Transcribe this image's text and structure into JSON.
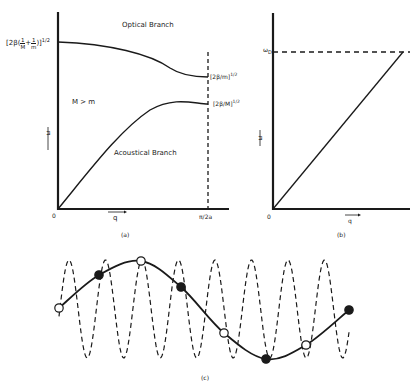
{
  "panel_a": {
    "caption": "(a)",
    "optical_label": "Optical Branch",
    "acoustical_label": "Acoustical Branch",
    "condition_label": "M > m",
    "y_axis_symbol": "ω",
    "x_axis_symbol": "q",
    "origin_label": "0",
    "x_max_label": "π/2a",
    "optical_top_label": "[2β(1/M + 1/m)]^1/2",
    "optical_top_text": "[2β(",
    "optical_top_frac1_num": "1",
    "optical_top_frac1_den": "M",
    "optical_top_plus": "+",
    "optical_top_frac2_num": "1",
    "optical_top_frac2_den": "m",
    "optical_top_close": ")]",
    "optical_top_exp": "1/2",
    "optical_edge_label": "[2β/m]^1/2",
    "optical_edge_text": "[2β/m]",
    "optical_edge_exp": "1/2",
    "acoustic_edge_label": "[2β/M]^1/2",
    "acoustic_edge_text": "[2β/M]",
    "acoustic_edge_exp": "1/2"
  },
  "panel_b": {
    "caption": "(b)",
    "y_axis_symbol": "ω",
    "x_axis_symbol": "q",
    "origin_label": "0",
    "cutoff_label": "ωD",
    "cutoff_main": "ω",
    "cutoff_sub": "D"
  },
  "panel_c": {
    "caption": "(c)",
    "solid_curve_points": [
      {
        "x": 59,
        "y": 308,
        "fill": "open"
      },
      {
        "x": 99,
        "y": 275,
        "fill": "filled"
      },
      {
        "x": 141,
        "y": 261,
        "fill": "open"
      },
      {
        "x": 181,
        "y": 287,
        "fill": "filled"
      },
      {
        "x": 224,
        "y": 333,
        "fill": "open"
      },
      {
        "x": 266,
        "y": 359,
        "fill": "filled"
      },
      {
        "x": 306,
        "y": 345,
        "fill": "open"
      },
      {
        "x": 349,
        "y": 310,
        "fill": "filled"
      }
    ],
    "dashed_wave": {
      "x_start": 59,
      "x_end": 349,
      "peak_y": 260,
      "trough_y": 358,
      "period_px": 36.5
    }
  },
  "colors": {
    "ink": "#1a1a1a",
    "background": "#ffffff"
  }
}
